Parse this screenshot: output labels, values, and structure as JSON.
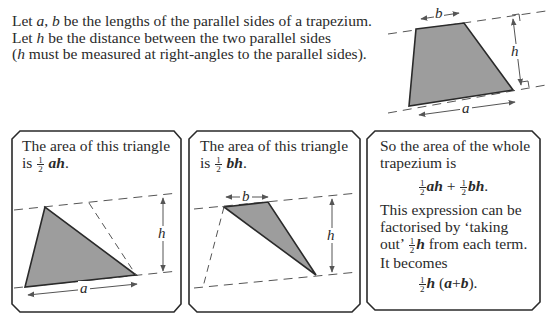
{
  "intro": {
    "line1": {
      "pre": "Let ",
      "var_a": "a",
      "sep": ", ",
      "var_b": "b",
      "post": " be the lengths of the parallel sides of a trapezium."
    },
    "line2": {
      "pre": "Let ",
      "var_h": "h",
      "post": " be the distance between the two parallel sides"
    },
    "line3": {
      "open": "(",
      "var_h": "h",
      "post": " must be measured at right-angles to the parallel sides)."
    }
  },
  "top_diagram": {
    "label_a": "a",
    "label_b": "b",
    "label_h": "h",
    "fill_color": "#9d9d9d",
    "stroke_color": "#2a2a2a"
  },
  "box1": {
    "line1": "The area of this triangle",
    "line2_pre": "is ",
    "frac_num": "1",
    "frac_den": "2",
    "expr": "ah",
    "line2_post": ".",
    "label_a": "a",
    "label_h": "h"
  },
  "box2": {
    "line1": "The area of this triangle",
    "line2_pre": "is ",
    "frac_num": "1",
    "frac_den": "2",
    "expr": "bh",
    "line2_post": ".",
    "label_b": "b",
    "label_h": "h"
  },
  "box3": {
    "line1": "So the area of the whole",
    "line2": "trapezium is",
    "formula1": {
      "num": "1",
      "den": "2",
      "t1": "ah",
      "plus": " + ",
      "t2": "bh",
      "end": "."
    },
    "line3": "This expression can be",
    "line4": "factorised by ‘taking",
    "line5_pre": "out’ ",
    "line5_var": "h",
    "line5_post": " from each term.",
    "line6": "It becomes",
    "formula2": {
      "num": "1",
      "den": "2",
      "h": "h",
      "open": " (",
      "a": "a",
      "plus": "+",
      "b": "b",
      "close": ")."
    }
  }
}
